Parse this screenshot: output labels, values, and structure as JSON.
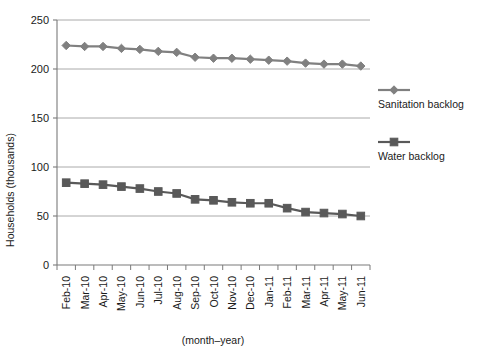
{
  "chart_data": {
    "type": "line",
    "title": "",
    "xlabel": "(month–year)",
    "ylabel": "Households (thousands)",
    "ylim": [
      0,
      250
    ],
    "yticks": [
      0,
      50,
      100,
      150,
      200,
      250
    ],
    "ytick_labels": [
      "0",
      "50",
      "100",
      "150",
      "200",
      "250"
    ],
    "grid": "horizontal",
    "legend_position": "right",
    "categories": [
      "Feb-10",
      "Mar-10",
      "Apr-10",
      "May-10",
      "Jun-10",
      "Jul-10",
      "Aug-10",
      "Sep-10",
      "Oct-10",
      "Nov-10",
      "Dec-10",
      "Jan-11",
      "Feb-11",
      "Mar-11",
      "Apr-11",
      "May-11",
      "Jun-11"
    ],
    "series": [
      {
        "name": "Sanitation backlog",
        "marker": "diamond",
        "color": "#808080",
        "values": [
          224,
          223,
          223,
          221,
          220,
          218,
          217,
          212,
          211,
          211,
          210,
          209,
          208,
          206,
          205,
          205,
          203
        ]
      },
      {
        "name": "Water backlog",
        "marker": "square",
        "color": "#595959",
        "values": [
          84,
          83,
          82,
          80,
          78,
          75,
          73,
          67,
          66,
          64,
          63,
          63,
          58,
          54,
          53,
          52,
          50
        ]
      }
    ]
  },
  "axes": {
    "y_title": "Households (thousands)",
    "x_title": "(month–year)",
    "y_tick_0": "0",
    "y_tick_1": "50",
    "y_tick_2": "100",
    "y_tick_3": "150",
    "y_tick_4": "200",
    "y_tick_5": "250"
  },
  "legend": {
    "items": [
      {
        "label": "Sanitation backlog",
        "color": "#808080",
        "marker": "diamond"
      },
      {
        "label": "Water backlog",
        "color": "#595959",
        "marker": "square"
      }
    ]
  },
  "colors": {
    "sanitation": "#808080",
    "water": "#595959",
    "gridline": "#aaaaaa",
    "axis": "#7a7a7a",
    "text": "#1a1a1a",
    "background": "#ffffff"
  }
}
